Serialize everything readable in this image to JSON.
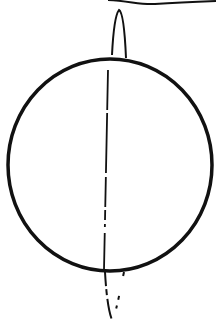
{
  "diagram": {
    "stroke_color": "#111111",
    "background": "#ffffff",
    "circle": {
      "cx": 110,
      "cy": 166,
      "rx": 102,
      "ry": 106
    },
    "axis": {
      "x_top": 108,
      "y_top": 60,
      "x_bottom": 104,
      "y_bottom": 270
    },
    "top_loop": {
      "tip_x": 119,
      "tip_y": 10
    },
    "bottom_loop": {
      "tip_x": 112,
      "tip_y": 320
    },
    "top_curve": {
      "visible": true
    }
  }
}
